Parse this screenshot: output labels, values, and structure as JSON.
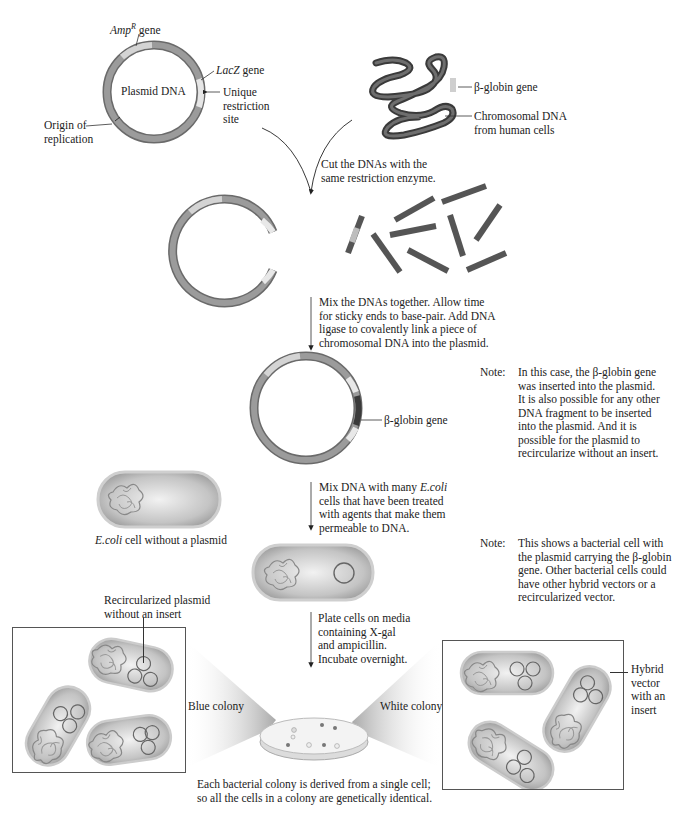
{
  "step0": {
    "plasmid": {
      "title": "Plasmid DNA",
      "ampr_label_base": "Amp",
      "ampr_label_sup": "R",
      "ampr_label_suffix": " gene",
      "lacz_label_italic": "LacZ",
      "lacz_label_suffix": " gene",
      "restriction_site": [
        "Unique",
        "restriction",
        "site"
      ],
      "origin": [
        "Origin of",
        "replication"
      ]
    },
    "chromosome": {
      "gene_label": "β-globin gene",
      "dna_label": [
        "Chromosomal DNA",
        "from human cells"
      ]
    }
  },
  "steps": [
    {
      "id": "cut",
      "lines": [
        "Cut the DNAs with the",
        "same restriction enzyme."
      ]
    },
    {
      "id": "mix",
      "lines": [
        "Mix the DNAs together. Allow time",
        "for sticky ends to base-pair. Add DNA",
        "ligase to covalently link a piece of",
        "chromosomal DNA into the plasmid."
      ]
    },
    {
      "id": "transform",
      "lines_rich": [
        [
          "Mix DNA with many ",
          "E.coli",
          ""
        ],
        [
          "cells that have been treated",
          "",
          ""
        ],
        [
          "with agents that make them",
          "",
          ""
        ],
        [
          "permeable to DNA.",
          "",
          ""
        ]
      ]
    },
    {
      "id": "plate",
      "lines": [
        "Plate cells on media",
        "containing X-gal",
        "and ampicillin.",
        "Incubate overnight."
      ]
    }
  ],
  "hybrid_plasmid": {
    "gene_label": "β-globin gene"
  },
  "notes": [
    {
      "label": "Note:",
      "lines": [
        "In this case, the β-globin gene",
        "was inserted into the plasmid.",
        "It is also possible for any other",
        "DNA fragment to be inserted",
        "into the plasmid. And it is",
        "possible for the plasmid to",
        "recircularize without an insert."
      ]
    },
    {
      "label": "Note:",
      "lines": [
        "This shows a bacterial cell with",
        "the plasmid carrying the β-globin",
        "gene. Other bacterial cells could",
        "have other hybrid vectors or a",
        "recircularized vector."
      ]
    }
  ],
  "ecoli": {
    "italic": "E.coli",
    "rest": " cell without a plasmid"
  },
  "colonies": {
    "blue_label": "Blue colony",
    "white_label": "White colony",
    "recirc_label": [
      "Recircularized plasmid",
      "without an insert"
    ],
    "hybrid_label": [
      "Hybrid",
      "vector",
      "with an",
      "insert"
    ]
  },
  "caption": [
    "Each bacterial colony is derived from a single cell;",
    "so all the cells in a colony are genetically identical."
  ],
  "colors": {
    "dna_dark": "#555555",
    "dna_mid": "#8a8a8a",
    "dna_light": "#cfcfcf",
    "cell_fill": "#b9b9b9",
    "text": "#222222"
  }
}
